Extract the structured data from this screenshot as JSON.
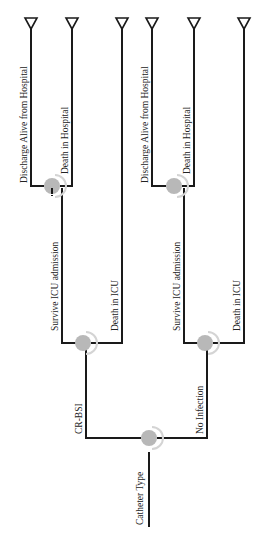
{
  "diagram": {
    "type": "decision-tree",
    "orientation": "rotated-90-ccw",
    "root": {
      "label": "Catheter Type",
      "branches": [
        {
          "label": "CR-BSI",
          "branches": [
            {
              "label": "Survive ICU admission",
              "branches": [
                {
                  "label": "Discharge Alive from Hospital",
                  "terminal": true
                },
                {
                  "label": "Death in Hospital",
                  "terminal": true
                }
              ]
            },
            {
              "label": "Death in ICU",
              "terminal": true
            }
          ]
        },
        {
          "label": "No Infection",
          "branches": [
            {
              "label": "Survive ICU admission",
              "branches": [
                {
                  "label": "Discharge Alive from Hospital",
                  "terminal": true
                },
                {
                  "label": "Death in Hospital",
                  "terminal": true
                }
              ]
            },
            {
              "label": "Death in ICU",
              "terminal": true
            }
          ]
        }
      ]
    },
    "labels": {
      "root": "Catheter Type",
      "crbsi": "CR-BSI",
      "no_infection": "No Infection",
      "a_survive": "Survive ICU admission",
      "a_death_icu": "Death in ICU",
      "a_discharge": "Discharge Alive from Hospital",
      "a_death_hosp": "Death in Hospital",
      "b_survive": "Survive ICU admission",
      "b_death_icu": "Death in ICU",
      "b_discharge": "Discharge Alive from Hospital",
      "b_death_hosp": "Death in Hospital"
    },
    "colors": {
      "line": "#1a1a1a",
      "chance_node": "#b8b8b8",
      "background": "#ffffff"
    }
  }
}
